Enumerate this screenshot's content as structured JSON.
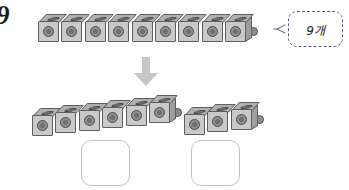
{
  "worksheet": {
    "problem_number": "9",
    "background_color": "#ffffff"
  },
  "callout": {
    "text": "9개",
    "border_style": "dashed",
    "border_color": "#5a5a7a",
    "connector_icon": "left-pointer-icon"
  },
  "arrow": {
    "icon": "down-arrow-icon",
    "color": "#c4c4c4",
    "direction": "down"
  },
  "cubes": {
    "front_color": "#c9c9c9",
    "top_color": "#b0b0b0",
    "side_color": "#9e9e9e",
    "stud_color": "#8f8f8f",
    "outline_color": "#5f5f5f"
  },
  "top_row": {
    "label": "9개",
    "count": 9,
    "cube_indices": [
      1,
      2,
      3,
      4,
      5,
      6,
      7,
      8,
      9
    ]
  },
  "bottom_groups": [
    {
      "name": "left-group",
      "count": 6,
      "cube_indices": [
        1,
        2,
        3,
        4,
        5,
        6
      ],
      "answer_value": ""
    },
    {
      "name": "right-group",
      "count": 3,
      "cube_indices": [
        1,
        2,
        3
      ],
      "answer_value": ""
    }
  ],
  "answer_boxes": [
    {
      "name": "left-answer-box",
      "value": "",
      "placeholder": ""
    },
    {
      "name": "right-answer-box",
      "value": "",
      "placeholder": ""
    }
  ]
}
